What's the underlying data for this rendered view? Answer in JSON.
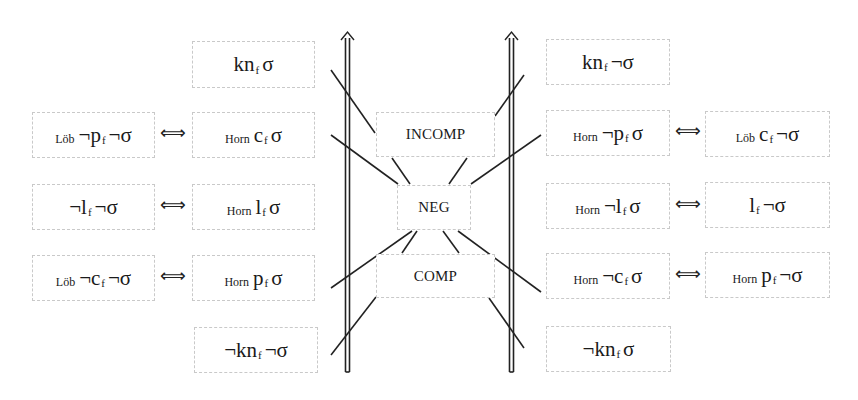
{
  "diagram": {
    "left_outer": [
      {
        "prefix": "Löb",
        "pre_main": "¬p",
        "sub": "f",
        "post_main": "¬σ"
      },
      {
        "prefix": "",
        "pre_main": "¬l",
        "sub": "f",
        "post_main": "¬σ"
      },
      {
        "prefix": "Löb",
        "pre_main": "¬c",
        "sub": "f",
        "post_main": "¬σ"
      }
    ],
    "left_inner": [
      {
        "prefix": "",
        "pre_main": "kn",
        "sub": "f",
        "post_main": "σ"
      },
      {
        "prefix": "Horn",
        "pre_main": "c",
        "sub": "f",
        "post_main": "σ"
      },
      {
        "prefix": "Horn",
        "pre_main": "l",
        "sub": "f",
        "post_main": "σ"
      },
      {
        "prefix": "Horn",
        "pre_main": "p",
        "sub": "f",
        "post_main": "σ"
      },
      {
        "prefix": "",
        "pre_main": "¬kn",
        "sub": "f",
        "post_main": "¬σ"
      }
    ],
    "center": [
      {
        "label": "INCOMP"
      },
      {
        "label": "NEG"
      },
      {
        "label": "COMP"
      }
    ],
    "right_inner": [
      {
        "prefix": "",
        "pre_main": "kn",
        "sub": "f",
        "post_main": "¬σ"
      },
      {
        "prefix": "Horn",
        "pre_main": "¬p",
        "sub": "f",
        "post_main": "σ"
      },
      {
        "prefix": "Horn",
        "pre_main": "¬l",
        "sub": "f",
        "post_main": "σ"
      },
      {
        "prefix": "Horn",
        "pre_main": "¬c",
        "sub": "f",
        "post_main": "σ"
      },
      {
        "prefix": "",
        "pre_main": "¬kn",
        "sub": "f",
        "post_main": "σ"
      }
    ],
    "right_outer": [
      {
        "prefix": "Löb",
        "pre_main": "c",
        "sub": "f",
        "post_main": "¬σ"
      },
      {
        "prefix": "",
        "pre_main": "l",
        "sub": "f",
        "post_main": "¬σ"
      },
      {
        "prefix": "Horn",
        "pre_main": "p",
        "sub": "f",
        "post_main": "¬σ"
      }
    ],
    "equivalence_symbol": "⟺"
  }
}
